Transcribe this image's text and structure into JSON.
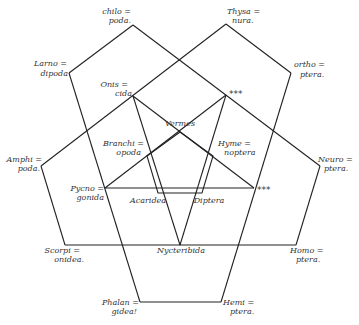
{
  "diagram": {
    "type": "five-set pentagon Venn diagram",
    "outer_labels": [
      {
        "id": "chilopoda",
        "lines": [
          "chilo =",
          "poda."
        ]
      },
      {
        "id": "thysanura",
        "lines": [
          "Thysa =",
          "nura."
        ]
      },
      {
        "id": "larnodipoda",
        "lines": [
          "Larno =",
          "dipoda"
        ]
      },
      {
        "id": "orthoptera",
        "lines": [
          "ortho =",
          "ptera."
        ]
      },
      {
        "id": "oniscida",
        "lines": [
          "Onis =",
          "cida"
        ]
      },
      {
        "id": "amphipoda",
        "lines": [
          "Amphi =",
          "poda."
        ]
      },
      {
        "id": "neuroptera",
        "lines": [
          "Neuro =",
          "ptera."
        ]
      },
      {
        "id": "branchiopoda",
        "lines": [
          "Branchi =",
          "opoda"
        ]
      },
      {
        "id": "hymenoptera",
        "lines": [
          "Hyme =",
          "noptera"
        ]
      },
      {
        "id": "pycnogonida",
        "lines": [
          "Pycno =",
          "gonida"
        ]
      },
      {
        "id": "scorpionidea",
        "lines": [
          "Scorpi =",
          "onidea."
        ]
      },
      {
        "id": "homoptera",
        "lines": [
          "Homo =",
          "ptera."
        ]
      },
      {
        "id": "phalangidea",
        "lines": [
          "Phalan =",
          "gidea!"
        ]
      },
      {
        "id": "hemiptera",
        "lines": [
          "Hemi =",
          "ptera."
        ]
      }
    ],
    "inner_labels": {
      "vermes": "Vermes",
      "acaridea": "Acaridea",
      "diptera": "Diptera",
      "nycteribida": "Nycteribida"
    },
    "markers": {
      "top": "***",
      "right": "***"
    }
  }
}
